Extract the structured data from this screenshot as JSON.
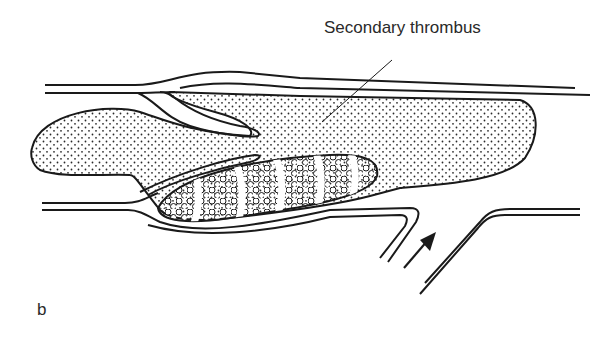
{
  "diagram": {
    "annotation": "Secondary thrombus",
    "panel_label": "b",
    "colors": {
      "line": "#1a1a1a",
      "background": "#ffffff",
      "stipple": "#2a2a2a"
    },
    "elements": [
      "vessel-wall-upper",
      "vessel-wall-lower",
      "valve-cusp-upper",
      "valve-cusp-lower",
      "secondary-thrombus",
      "primary-thrombus-laminated",
      "side-branch-vessel",
      "blood-flow-arrow"
    ]
  }
}
